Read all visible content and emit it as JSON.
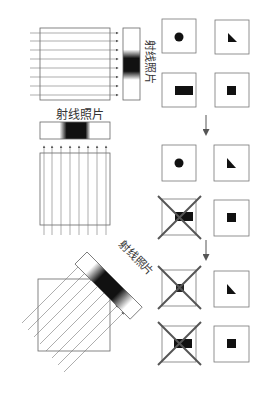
{
  "labels": {
    "film_1": "射线照片",
    "film_2": "射线照片",
    "film_3": "射线照片"
  },
  "colors": {
    "line": "#555555",
    "box": "#777777",
    "cross": "#555555",
    "shape": "#111111"
  },
  "diagram": {
    "projections": [
      {
        "name": "horizontal",
        "direction": "left-to-right",
        "ray_count": 8
      },
      {
        "name": "vertical",
        "direction": "bottom-to-top",
        "ray_count": 8
      },
      {
        "name": "diagonal",
        "direction": "lower-left-to-upper-right",
        "ray_count": 8
      }
    ],
    "grid_stages": [
      {
        "stage": 1,
        "cells": [
          "circle",
          "triangle",
          "rectangle",
          "square"
        ],
        "crossed": []
      },
      {
        "stage": 2,
        "cells": [
          "circle",
          "triangle",
          "rectangle",
          "square"
        ],
        "crossed": [
          "rectangle"
        ]
      },
      {
        "stage": 3,
        "cells": [
          "small-square",
          "triangle",
          "rectangle",
          "square"
        ],
        "crossed": [
          "small-square",
          "rectangle"
        ]
      }
    ]
  }
}
